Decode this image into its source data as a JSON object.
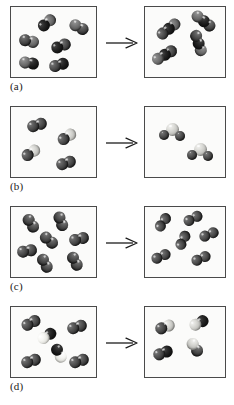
{
  "figure": {
    "type": "molecular-reaction-diagram",
    "panel_count": 4,
    "arrow_glyph": "reaction-arrow-right"
  },
  "colors": {
    "box_border": "#4a4a4a",
    "box_fill": "#fbfbfa",
    "page_background": "#ffffff",
    "arrow": "#1c1c1c",
    "label_text": "#1a1a1a",
    "atom_dark": "#3e3e3e",
    "atom_mid": "#606060",
    "atom_light": "#c0c0bc",
    "atom_white": "#e2e2dd",
    "atom_black": "#121212"
  },
  "panels": [
    {
      "label": "(a)",
      "reactants": {
        "name": "reactant-box-a",
        "molecule_count": 6,
        "molecules": [
          {
            "atoms": 2,
            "shades": [
              "black",
              "mid"
            ],
            "x": 26,
            "y": 10,
            "rot": -40
          },
          {
            "atoms": 2,
            "shades": [
              "mid",
              "dark"
            ],
            "x": 58,
            "y": 14,
            "rot": 28
          },
          {
            "atoms": 2,
            "shades": [
              "dark",
              "mid"
            ],
            "x": 8,
            "y": 28,
            "rot": 12
          },
          {
            "atoms": 2,
            "shades": [
              "black",
              "dark"
            ],
            "x": 40,
            "y": 33,
            "rot": -22
          },
          {
            "atoms": 2,
            "shades": [
              "mid",
              "black"
            ],
            "x": 8,
            "y": 50,
            "rot": 8
          },
          {
            "atoms": 2,
            "shades": [
              "dark",
              "black"
            ],
            "x": 38,
            "y": 52,
            "rot": -16
          }
        ]
      },
      "products": {
        "name": "product-box-a",
        "molecule_count": 4,
        "molecules": [
          {
            "atoms": 3,
            "shades": [
              "dark",
              "black",
              "mid"
            ],
            "x": 10,
            "y": 16,
            "rot": -38
          },
          {
            "atoms": 3,
            "shades": [
              "mid",
              "black",
              "dark"
            ],
            "x": 45,
            "y": 8,
            "rot": 38
          },
          {
            "atoms": 3,
            "shades": [
              "dark",
              "black",
              "mid"
            ],
            "x": 40,
            "y": 30,
            "rot": 72
          },
          {
            "atoms": 3,
            "shades": [
              "mid",
              "black",
              "dark"
            ],
            "x": 6,
            "y": 42,
            "rot": -30
          }
        ]
      }
    },
    {
      "label": "(b)",
      "reactants": {
        "name": "reactant-box-b",
        "molecule_count": 4,
        "molecules": [
          {
            "atoms": 2,
            "shades": [
              "dark",
              "dark"
            ],
            "x": 16,
            "y": 12,
            "rot": -18
          },
          {
            "atoms": 2,
            "shades": [
              "dark",
              "light"
            ],
            "x": 46,
            "y": 24,
            "rot": -34
          },
          {
            "atoms": 2,
            "shades": [
              "dark",
              "light"
            ],
            "x": 10,
            "y": 40,
            "rot": -34
          },
          {
            "atoms": 2,
            "shades": [
              "dark",
              "dark"
            ],
            "x": 45,
            "y": 50,
            "rot": -18
          }
        ]
      },
      "products": {
        "name": "product-box-b",
        "molecule_count": 2,
        "molecules": [
          {
            "atoms": 3,
            "shades": [
              "dark",
              "light",
              "dark"
            ],
            "x": 14,
            "y": 14,
            "rot": 0,
            "bent": true
          },
          {
            "atoms": 3,
            "shades": [
              "dark",
              "light",
              "dark"
            ],
            "x": 42,
            "y": 34,
            "rot": 0,
            "bent": true
          }
        ]
      }
    },
    {
      "label": "(c)",
      "reactants": {
        "name": "reactant-box-c",
        "molecule_count": 7,
        "molecules": [
          {
            "atoms": 2,
            "shades": [
              "dark",
              "dark"
            ],
            "x": 10,
            "y": 10,
            "rot": 56
          },
          {
            "atoms": 2,
            "shades": [
              "dark",
              "dark"
            ],
            "x": 40,
            "y": 8,
            "rot": 70
          },
          {
            "atoms": 2,
            "shades": [
              "dark",
              "dark"
            ],
            "x": 28,
            "y": 27,
            "rot": 40
          },
          {
            "atoms": 2,
            "shades": [
              "dark",
              "dark"
            ],
            "x": 58,
            "y": 26,
            "rot": -14
          },
          {
            "atoms": 2,
            "shades": [
              "dark",
              "dark"
            ],
            "x": 6,
            "y": 38,
            "rot": -10
          },
          {
            "atoms": 2,
            "shades": [
              "dark",
              "dark"
            ],
            "x": 24,
            "y": 50,
            "rot": 62
          },
          {
            "atoms": 2,
            "shades": [
              "dark",
              "dark"
            ],
            "x": 54,
            "y": 48,
            "rot": 62
          }
        ]
      },
      "products": {
        "name": "product-box-c",
        "molecule_count": 6,
        "molecules": [
          {
            "atoms": 2,
            "shades": [
              "dark",
              "dark"
            ],
            "x": 8,
            "y": 10,
            "rot": -56,
            "long": true
          },
          {
            "atoms": 2,
            "shades": [
              "dark",
              "dark"
            ],
            "x": 38,
            "y": 6,
            "rot": -28,
            "long": true
          },
          {
            "atoms": 2,
            "shades": [
              "dark",
              "dark"
            ],
            "x": 54,
            "y": 22,
            "rot": -22,
            "long": true
          },
          {
            "atoms": 2,
            "shades": [
              "dark",
              "dark"
            ],
            "x": 28,
            "y": 28,
            "rot": -64,
            "long": true
          },
          {
            "atoms": 2,
            "shades": [
              "dark",
              "dark"
            ],
            "x": 6,
            "y": 44,
            "rot": -24,
            "long": true
          },
          {
            "atoms": 2,
            "shades": [
              "dark",
              "dark"
            ],
            "x": 46,
            "y": 46,
            "rot": -24,
            "long": true
          }
        ]
      }
    },
    {
      "label": "(d)",
      "reactants": {
        "name": "reactant-box-d",
        "molecule_count": 6,
        "molecules": [
          {
            "atoms": 2,
            "shades": [
              "dark",
              "dark"
            ],
            "x": 10,
            "y": 10,
            "rot": -28
          },
          {
            "atoms": 2,
            "shades": [
              "white",
              "black"
            ],
            "x": 26,
            "y": 23,
            "rot": -32
          },
          {
            "atoms": 2,
            "shades": [
              "dark",
              "dark"
            ],
            "x": 56,
            "y": 14,
            "rot": -18
          },
          {
            "atoms": 2,
            "shades": [
              "black",
              "white"
            ],
            "x": 38,
            "y": 40,
            "rot": 62
          },
          {
            "atoms": 2,
            "shades": [
              "dark",
              "dark"
            ],
            "x": 10,
            "y": 48,
            "rot": -18
          },
          {
            "atoms": 2,
            "shades": [
              "dark",
              "dark"
            ],
            "x": 58,
            "y": 48,
            "rot": -18
          }
        ]
      },
      "products": {
        "name": "product-box-d",
        "molecule_count": 4,
        "molecules": [
          {
            "atoms": 2,
            "shades": [
              "dark",
              "light"
            ],
            "x": 10,
            "y": 14,
            "rot": -20
          },
          {
            "atoms": 2,
            "shades": [
              "light",
              "black"
            ],
            "x": 44,
            "y": 10,
            "rot": -26
          },
          {
            "atoms": 2,
            "shades": [
              "dark",
              "black"
            ],
            "x": 8,
            "y": 40,
            "rot": -20
          },
          {
            "atoms": 2,
            "shades": [
              "light",
              "dark"
            ],
            "x": 40,
            "y": 34,
            "rot": 56
          }
        ]
      }
    }
  ]
}
